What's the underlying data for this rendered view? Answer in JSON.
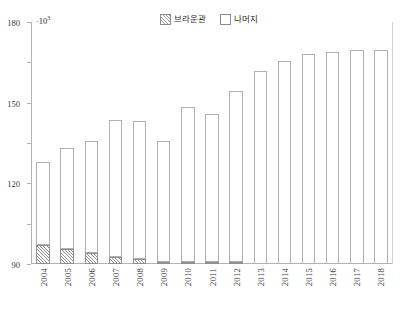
{
  "chart_data": {
    "type": "bar",
    "subtype": "stacked-bar",
    "title": "",
    "xlabel": "",
    "ylabel": "",
    "unit_note": "·10",
    "unit_exponent": "3",
    "ylim": [
      0,
      180
    ],
    "yticks": [
      0,
      30,
      60,
      90,
      120,
      150,
      180
    ],
    "ytick_labels": [
      "0",
      "30",
      "60",
      "90",
      "120",
      "150",
      "180"
    ],
    "grid": false,
    "legend_position": "top-center",
    "categories": [
      "2004",
      "2005",
      "2006",
      "2007",
      "2008",
      "2009",
      "2010",
      "2011",
      "2012",
      "2013",
      "2014",
      "2015",
      "2016",
      "2017",
      "2018"
    ],
    "series": [
      {
        "name": "브라운관",
        "fill": "hatched",
        "values": [
          14.5,
          11.5,
          8.0,
          5.5,
          3.5,
          1.5,
          1.0,
          0.8,
          0.5,
          0.0,
          0.0,
          0.0,
          0.0,
          0.0,
          0.0
        ]
      },
      {
        "name": "나머지",
        "fill": "white",
        "values": [
          61.5,
          74.5,
          83.5,
          101.5,
          103.0,
          90.0,
          115.0,
          110.2,
          127.5,
          143.5,
          151.0,
          156.0,
          157.5,
          159.5,
          159.0
        ]
      }
    ],
    "totals": [
      76.0,
      86.0,
      91.5,
      107.0,
      106.5,
      91.5,
      116.0,
      111.0,
      128.0,
      143.5,
      151.0,
      156.0,
      157.5,
      159.5,
      159.0
    ]
  },
  "legend": {
    "items": [
      {
        "label": "브라운관",
        "swatch": "hatched-swatch"
      },
      {
        "label": "나머지",
        "swatch": "white-swatch"
      }
    ]
  },
  "colors": {
    "axis": "#b4b4b4",
    "bar_outline": "#a8a8a8",
    "hatch": "#8f8f8f",
    "text": "#3a3a3a",
    "background": "#ffffff"
  }
}
